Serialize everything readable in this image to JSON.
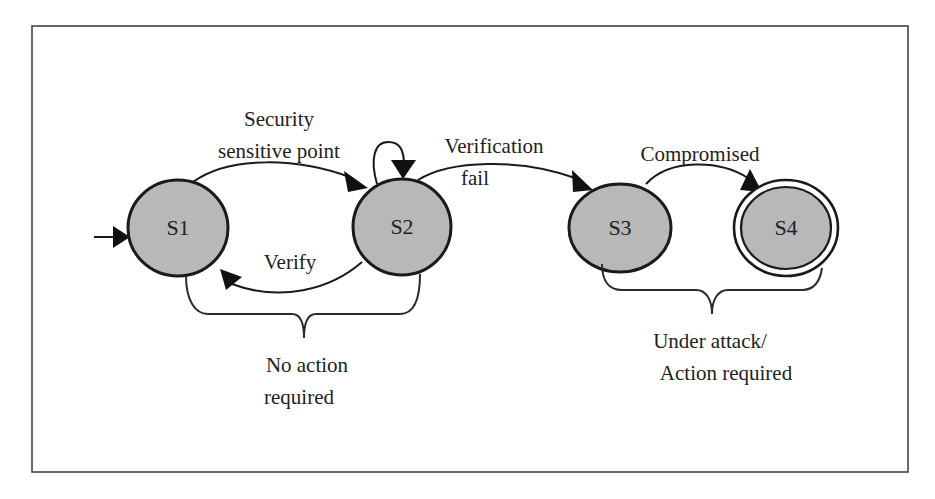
{
  "diagram": {
    "type": "state-machine",
    "colors": {
      "state_fill": "#b8b8b8",
      "stroke": "#1a1a1a",
      "frame": "#444444",
      "text": "#222222",
      "background": "#ffffff"
    },
    "states": [
      {
        "id": "S1",
        "label": "S1",
        "initial": true,
        "final": false
      },
      {
        "id": "S2",
        "label": "S2",
        "initial": false,
        "final": false
      },
      {
        "id": "S3",
        "label": "S3",
        "initial": false,
        "final": false
      },
      {
        "id": "S4",
        "label": "S4",
        "initial": false,
        "final": true
      }
    ],
    "transitions": [
      {
        "from": "S1",
        "to": "S2",
        "label_lines": [
          "Security",
          "sensitive point"
        ]
      },
      {
        "from": "S2",
        "to": "S2",
        "label_lines": []
      },
      {
        "from": "S2",
        "to": "S1",
        "label_lines": [
          "Verify"
        ]
      },
      {
        "from": "S2",
        "to": "S3",
        "label_lines": [
          "Verification",
          "fail"
        ]
      },
      {
        "from": "S3",
        "to": "S4",
        "label_lines": [
          "Compromised"
        ]
      }
    ],
    "groups": [
      {
        "members": [
          "S1",
          "S2"
        ],
        "label_lines": [
          "No action",
          "required"
        ]
      },
      {
        "members": [
          "S3",
          "S4"
        ],
        "label_lines": [
          "Under attack/",
          "Action required"
        ]
      }
    ]
  }
}
